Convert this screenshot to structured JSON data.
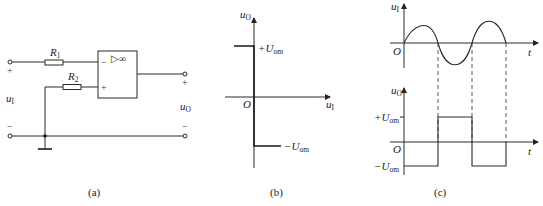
{
  "figure": {
    "panels": [
      {
        "id": "a",
        "caption": "(a)",
        "type": "circuit"
      },
      {
        "id": "b",
        "caption": "(b)",
        "type": "transfer-characteristic"
      },
      {
        "id": "c",
        "caption": "(c)",
        "type": "waveforms"
      }
    ]
  },
  "circuit": {
    "r1": {
      "name": "R",
      "sub": "1"
    },
    "r2": {
      "name": "R",
      "sub": "2"
    },
    "opamp": {
      "symbol": "▷∞",
      "inv": "−",
      "noninv": "+"
    },
    "input": {
      "name": "u",
      "sub": "I",
      "plus": "+",
      "minus": "−"
    },
    "output": {
      "name": "u",
      "sub": "O",
      "plus": "+",
      "minus": "−"
    }
  },
  "transfer": {
    "y_axis": {
      "name": "u",
      "sub": "O"
    },
    "x_axis": {
      "name": "u",
      "sub": "I"
    },
    "origin": "O",
    "pos_level": {
      "prefix": "+",
      "name": "U",
      "sub": "om"
    },
    "neg_level": {
      "prefix": "−",
      "name": "U",
      "sub": "om"
    }
  },
  "waveforms": {
    "top": {
      "y_axis": {
        "name": "u",
        "sub": "I"
      },
      "x_axis": "t",
      "origin": "O"
    },
    "bottom": {
      "y_axis": {
        "name": "u",
        "sub": "O"
      },
      "x_axis": "t",
      "origin": "O",
      "pos_level": {
        "prefix": "+",
        "name": "U",
        "sub": "om"
      },
      "neg_level": {
        "prefix": "−",
        "name": "U",
        "sub": "om"
      }
    }
  }
}
